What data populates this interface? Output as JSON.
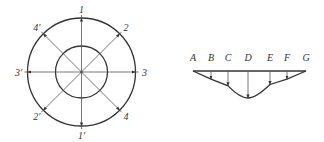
{
  "figure_left": {
    "title": "Radial arrows circle diagram",
    "labels": [
      "1",
      "2",
      "3",
      "4",
      "1′",
      "2′",
      "3′",
      "4′"
    ]
  },
  "figure_right": {
    "title": "Load distribution diagram",
    "points": [
      "A",
      "B",
      "C",
      "D",
      "E",
      "F",
      "G"
    ],
    "relative_depths": [
      0,
      0.3,
      0.55,
      1.0,
      0.5,
      0.3,
      0
    ]
  },
  "colors": {
    "line": "#333333",
    "background": "#ffffff"
  }
}
